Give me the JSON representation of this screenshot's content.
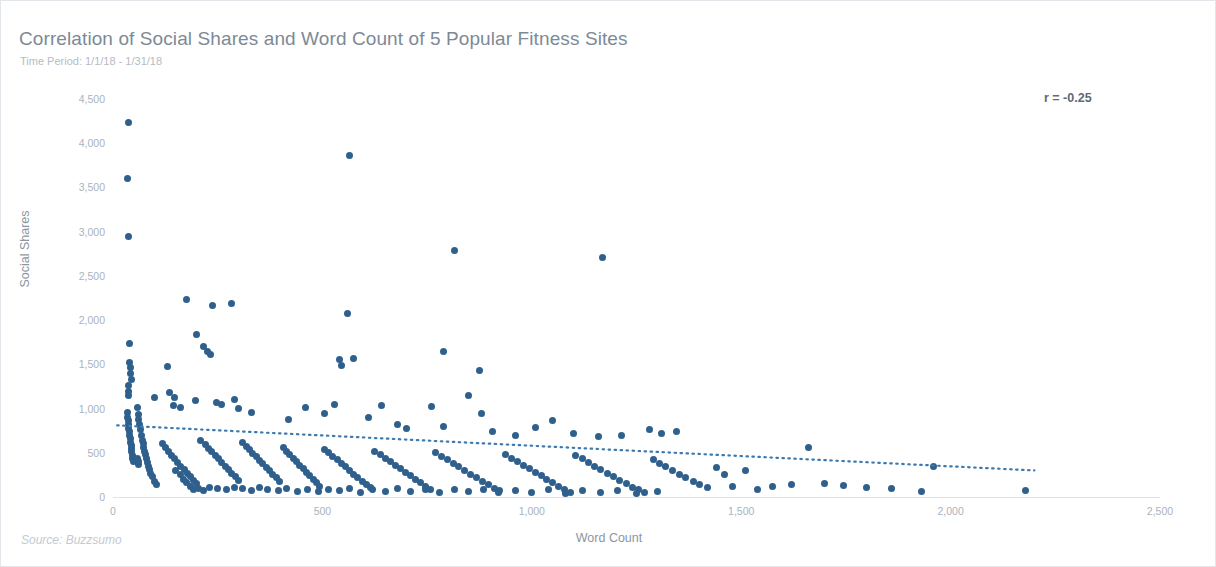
{
  "card": {
    "title": "Correlation of Social Shares and Word Count of 5 Popular Fitness Sites",
    "subtitle": "Time Period: 1/1/18 - 1/31/18",
    "source": "Source: Buzzsumo",
    "annotation": "r = -0.25",
    "border_color": "#e2e6ea",
    "background": "#ffffff"
  },
  "chart_data": {
    "type": "scatter",
    "title": "Correlation of Social Shares and Word Count of 5 Popular Fitness Sites",
    "subtitle": "Time Period: 1/1/18 - 1/31/18",
    "xlabel": "Word Count",
    "ylabel": "Social Shares",
    "source": "Source: Buzzsumo",
    "annotation": "r = -0.25",
    "correlation": -0.25,
    "grid": false,
    "legend": "none",
    "point_color": "#2f608d",
    "trend_color": "#3d7ab0",
    "trend_style": "dotted",
    "xlim": [
      0,
      2500
    ],
    "ylim": [
      0,
      4500
    ],
    "xticks": [
      0,
      500,
      1000,
      1500,
      2000,
      2500
    ],
    "xtick_labels": [
      "0",
      "500",
      "1,000",
      "1,500",
      "2,000",
      "2,500"
    ],
    "yticks": [
      0,
      500,
      1000,
      1500,
      2000,
      2500,
      3000,
      3500,
      4000,
      4500
    ],
    "ytick_labels": [
      "0",
      "500",
      "1,000",
      "1,500",
      "2,000",
      "2,500",
      "3,000",
      "3,500",
      "4,000",
      "4,500"
    ],
    "trendline": {
      "x0": 10,
      "y0": 810,
      "x1": 2200,
      "y1": 300
    },
    "points": [
      [
        38,
        4230
      ],
      [
        35,
        3600
      ],
      [
        36,
        2950
      ],
      [
        565,
        3860
      ],
      [
        815,
        2790
      ],
      [
        1170,
        2710
      ],
      [
        40,
        1740
      ],
      [
        175,
        2230
      ],
      [
        238,
        2165
      ],
      [
        284,
        2190
      ],
      [
        560,
        2075
      ],
      [
        200,
        1840
      ],
      [
        215,
        1700
      ],
      [
        225,
        1640
      ],
      [
        232,
        1610
      ],
      [
        540,
        1560
      ],
      [
        575,
        1570
      ],
      [
        545,
        1490
      ],
      [
        875,
        1430
      ],
      [
        790,
        1650
      ],
      [
        40,
        1520
      ],
      [
        41,
        1460
      ],
      [
        42,
        1395
      ],
      [
        43,
        1330
      ],
      [
        130,
        1480
      ],
      [
        36,
        1265
      ],
      [
        37,
        1195
      ],
      [
        38,
        1150
      ],
      [
        100,
        1120
      ],
      [
        145,
        1040
      ],
      [
        160,
        1015
      ],
      [
        196,
        1090
      ],
      [
        246,
        1070
      ],
      [
        260,
        1045
      ],
      [
        290,
        1100
      ],
      [
        300,
        1000
      ],
      [
        330,
        960
      ],
      [
        420,
        880
      ],
      [
        460,
        1010
      ],
      [
        505,
        940
      ],
      [
        530,
        1050
      ],
      [
        610,
        900
      ],
      [
        640,
        1040
      ],
      [
        680,
        820
      ],
      [
        700,
        770
      ],
      [
        760,
        1025
      ],
      [
        790,
        800
      ],
      [
        850,
        1145
      ],
      [
        880,
        940
      ],
      [
        905,
        745
      ],
      [
        960,
        700
      ],
      [
        1010,
        790
      ],
      [
        1050,
        860
      ],
      [
        1100,
        720
      ],
      [
        1160,
        680
      ],
      [
        1215,
        700
      ],
      [
        1280,
        760
      ],
      [
        1310,
        720
      ],
      [
        1345,
        745
      ],
      [
        34,
        960
      ],
      [
        35,
        900
      ],
      [
        36,
        860
      ],
      [
        37,
        820
      ],
      [
        38,
        780
      ],
      [
        39,
        740
      ],
      [
        40,
        700
      ],
      [
        41,
        660
      ],
      [
        42,
        620
      ],
      [
        43,
        580
      ],
      [
        44,
        545
      ],
      [
        45,
        510
      ],
      [
        46,
        470
      ],
      [
        47,
        430
      ],
      [
        48,
        400
      ],
      [
        60,
        930
      ],
      [
        62,
        880
      ],
      [
        64,
        820
      ],
      [
        66,
        760
      ],
      [
        68,
        700
      ],
      [
        70,
        640
      ],
      [
        72,
        600
      ],
      [
        74,
        560
      ],
      [
        76,
        520
      ],
      [
        78,
        480
      ],
      [
        80,
        430
      ],
      [
        82,
        390
      ],
      [
        84,
        350
      ],
      [
        86,
        310
      ],
      [
        90,
        270
      ],
      [
        95,
        230
      ],
      [
        100,
        180
      ],
      [
        105,
        140
      ],
      [
        58,
        1010
      ],
      [
        118,
        600
      ],
      [
        125,
        560
      ],
      [
        132,
        520
      ],
      [
        140,
        470
      ],
      [
        148,
        430
      ],
      [
        155,
        390
      ],
      [
        162,
        350
      ],
      [
        170,
        310
      ],
      [
        178,
        270
      ],
      [
        185,
        230
      ],
      [
        192,
        190
      ],
      [
        200,
        150
      ],
      [
        210,
        640
      ],
      [
        220,
        590
      ],
      [
        228,
        550
      ],
      [
        236,
        510
      ],
      [
        244,
        470
      ],
      [
        252,
        430
      ],
      [
        260,
        390
      ],
      [
        268,
        350
      ],
      [
        276,
        310
      ],
      [
        284,
        270
      ],
      [
        292,
        230
      ],
      [
        300,
        190
      ],
      [
        310,
        620
      ],
      [
        318,
        575
      ],
      [
        326,
        535
      ],
      [
        334,
        495
      ],
      [
        342,
        455
      ],
      [
        350,
        415
      ],
      [
        358,
        375
      ],
      [
        366,
        335
      ],
      [
        374,
        295
      ],
      [
        382,
        255
      ],
      [
        390,
        215
      ],
      [
        398,
        175
      ],
      [
        406,
        560
      ],
      [
        414,
        520
      ],
      [
        422,
        480
      ],
      [
        430,
        440
      ],
      [
        438,
        400
      ],
      [
        446,
        360
      ],
      [
        454,
        320
      ],
      [
        462,
        280
      ],
      [
        470,
        240
      ],
      [
        478,
        200
      ],
      [
        486,
        160
      ],
      [
        494,
        120
      ],
      [
        505,
        540
      ],
      [
        515,
        500
      ],
      [
        525,
        460
      ],
      [
        535,
        420
      ],
      [
        545,
        380
      ],
      [
        555,
        340
      ],
      [
        565,
        300
      ],
      [
        575,
        260
      ],
      [
        585,
        220
      ],
      [
        595,
        180
      ],
      [
        605,
        140
      ],
      [
        615,
        105
      ],
      [
        625,
        520
      ],
      [
        638,
        480
      ],
      [
        650,
        440
      ],
      [
        662,
        400
      ],
      [
        674,
        360
      ],
      [
        686,
        320
      ],
      [
        698,
        280
      ],
      [
        710,
        240
      ],
      [
        722,
        200
      ],
      [
        734,
        160
      ],
      [
        746,
        120
      ],
      [
        758,
        90
      ],
      [
        770,
        500
      ],
      [
        784,
        460
      ],
      [
        798,
        420
      ],
      [
        812,
        380
      ],
      [
        826,
        340
      ],
      [
        840,
        300
      ],
      [
        854,
        260
      ],
      [
        868,
        220
      ],
      [
        882,
        180
      ],
      [
        896,
        140
      ],
      [
        910,
        100
      ],
      [
        924,
        70
      ],
      [
        938,
        480
      ],
      [
        952,
        440
      ],
      [
        966,
        400
      ],
      [
        980,
        360
      ],
      [
        994,
        320
      ],
      [
        1008,
        280
      ],
      [
        1022,
        240
      ],
      [
        1036,
        200
      ],
      [
        1050,
        160
      ],
      [
        1064,
        120
      ],
      [
        1078,
        85
      ],
      [
        1092,
        55
      ],
      [
        1105,
        470
      ],
      [
        1120,
        430
      ],
      [
        1135,
        390
      ],
      [
        1150,
        350
      ],
      [
        1165,
        310
      ],
      [
        1180,
        270
      ],
      [
        1195,
        230
      ],
      [
        1210,
        190
      ],
      [
        1225,
        150
      ],
      [
        1240,
        110
      ],
      [
        1255,
        80
      ],
      [
        1270,
        50
      ],
      [
        1290,
        420
      ],
      [
        1305,
        380
      ],
      [
        1320,
        340
      ],
      [
        1335,
        300
      ],
      [
        1352,
        260
      ],
      [
        1368,
        220
      ],
      [
        1385,
        180
      ],
      [
        1400,
        140
      ],
      [
        1420,
        105
      ],
      [
        1440,
        330
      ],
      [
        1460,
        250
      ],
      [
        1480,
        120
      ],
      [
        1510,
        300
      ],
      [
        1540,
        90
      ],
      [
        1575,
        120
      ],
      [
        1620,
        140
      ],
      [
        1660,
        560
      ],
      [
        1700,
        150
      ],
      [
        1745,
        130
      ],
      [
        1800,
        110
      ],
      [
        1860,
        95
      ],
      [
        1930,
        60
      ],
      [
        1960,
        345
      ],
      [
        2180,
        75
      ],
      [
        150,
        300
      ],
      [
        160,
        250
      ],
      [
        168,
        200
      ],
      [
        176,
        160
      ],
      [
        184,
        120
      ],
      [
        192,
        85
      ],
      [
        205,
        100
      ],
      [
        215,
        70
      ],
      [
        230,
        110
      ],
      [
        250,
        95
      ],
      [
        270,
        80
      ],
      [
        290,
        110
      ],
      [
        135,
        1180
      ],
      [
        148,
        1130
      ],
      [
        58,
        430
      ],
      [
        60,
        400
      ],
      [
        62,
        370
      ],
      [
        310,
        95
      ],
      [
        330,
        75
      ],
      [
        350,
        110
      ],
      [
        370,
        85
      ],
      [
        395,
        70
      ],
      [
        415,
        95
      ],
      [
        440,
        65
      ],
      [
        465,
        90
      ],
      [
        490,
        60
      ],
      [
        515,
        85
      ],
      [
        540,
        70
      ],
      [
        565,
        95
      ],
      [
        590,
        55
      ],
      [
        620,
        85
      ],
      [
        650,
        65
      ],
      [
        680,
        95
      ],
      [
        710,
        60
      ],
      [
        745,
        80
      ],
      [
        780,
        55
      ],
      [
        815,
        90
      ],
      [
        850,
        60
      ],
      [
        885,
        80
      ],
      [
        920,
        50
      ],
      [
        960,
        75
      ],
      [
        1000,
        55
      ],
      [
        1040,
        80
      ],
      [
        1080,
        45
      ],
      [
        1120,
        70
      ],
      [
        1165,
        50
      ],
      [
        1205,
        75
      ],
      [
        1250,
        45
      ],
      [
        1300,
        65
      ]
    ]
  }
}
